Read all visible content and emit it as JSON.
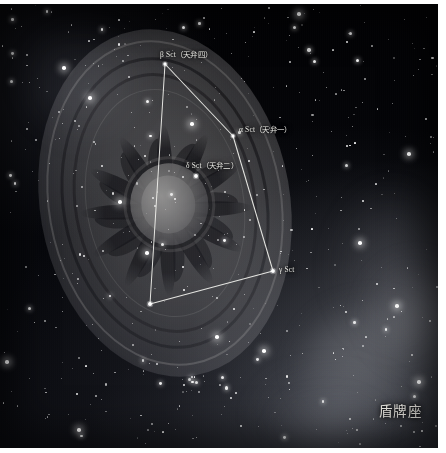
{
  "image": {
    "kind": "star-chart-illustration",
    "constellation_name_cn": "盾牌座",
    "background": "Milky Way star field with nebulosity",
    "artwork": "ornate oval shield with concentric rings, flame sunburst and central boss"
  },
  "colors": {
    "plate_background": "#040408",
    "line_color": "#f2f2ee",
    "label_color": "#e9e9e4",
    "star_color": "#ffffff",
    "frame": "#ffffff"
  },
  "stars": [
    {
      "id": "beta",
      "label": "β Sct（天弁四）",
      "x": 165,
      "y": 60,
      "mag": 3.0
    },
    {
      "id": "alpha",
      "label": "α Sct（天弁一）",
      "x": 233,
      "y": 132,
      "mag": 3.2
    },
    {
      "id": "delta",
      "label": "δ Sct（天弁二）",
      "x": 196,
      "y": 172,
      "mag": 2.2
    },
    {
      "id": "gamma",
      "label": "γ Sct",
      "x": 273,
      "y": 267,
      "mag": 2.2
    },
    {
      "id": "zeta",
      "label": "",
      "x": 150,
      "y": 300,
      "mag": 2.0
    }
  ],
  "constellation_lines": [
    {
      "from": "beta",
      "to": "alpha"
    },
    {
      "from": "alpha",
      "to": "gamma"
    },
    {
      "from": "gamma",
      "to": "zeta"
    },
    {
      "from": "zeta",
      "to": "beta"
    }
  ],
  "labels": {
    "beta": "β Sct（天弁四）",
    "alpha": "α Sct（天弁一）",
    "delta": "δ Sct（天弁二）",
    "gamma": "γ Sct",
    "constellation": "盾牌座"
  },
  "chart_data": {
    "type": "scatter",
    "title": "盾牌座",
    "xlabel": "",
    "ylabel": "",
    "xlim": [
      0,
      438
    ],
    "ylim": [
      0,
      444
    ],
    "grid": false,
    "legend": "none",
    "series": [
      {
        "name": "Scutum bright stars",
        "points": [
          {
            "label": "β Sct（天弁四）",
            "x": 165,
            "y": 60
          },
          {
            "label": "α Sct（天弁一）",
            "x": 233,
            "y": 132
          },
          {
            "label": "δ Sct（天弁二）",
            "x": 196,
            "y": 172
          },
          {
            "label": "γ Sct",
            "x": 273,
            "y": 267
          },
          {
            "label": "",
            "x": 150,
            "y": 300
          }
        ]
      }
    ],
    "annotations": [
      "β Sct（天弁四）",
      "α Sct（天弁一）",
      "δ Sct（天弁二）",
      "γ Sct",
      "盾牌座"
    ]
  }
}
